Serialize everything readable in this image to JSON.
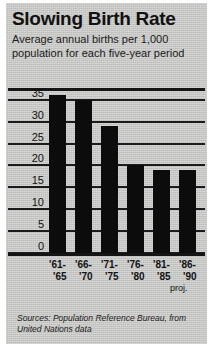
{
  "header": {
    "title": "Slowing Birth Rate",
    "subtitle": "Average annual births per 1,000 population for each five-year period"
  },
  "source": {
    "text": "Sources: Population Reference Bureau, from United Nations data"
  },
  "annotation": {
    "proj_label": "proj."
  },
  "chart_data": {
    "type": "bar",
    "title": "Slowing Birth Rate",
    "subtitle": "Average annual births per 1,000 population for each five-year period",
    "xlabel": "",
    "ylabel": "",
    "ylim": [
      0,
      37
    ],
    "yticks": [
      0,
      5,
      10,
      15,
      20,
      25,
      30,
      35
    ],
    "ytick_labels": [
      "0",
      "5",
      "10",
      "15",
      "20",
      "25",
      "30",
      "35"
    ],
    "grid": true,
    "legend": false,
    "bar_color": "#0c0c0c",
    "background_color": "#c9c9c7",
    "categories": [
      "'61-'65",
      "'66-'70",
      "'71-'75",
      "'76-'80",
      "'81-'85",
      "'86-'90"
    ],
    "category_lines": [
      [
        "'61-",
        "'65"
      ],
      [
        "'66-",
        "'70"
      ],
      [
        "'71-",
        "'75"
      ],
      [
        "'76-",
        "'80"
      ],
      [
        "'81-",
        "'85"
      ],
      [
        "'86-",
        "'90"
      ]
    ],
    "values": [
      36,
      35,
      29,
      20,
      19,
      19
    ],
    "annotations": [
      {
        "text": "proj.",
        "category": "'86-'90"
      }
    ],
    "source": "Sources: Population Reference Bureau, from United Nations data"
  }
}
